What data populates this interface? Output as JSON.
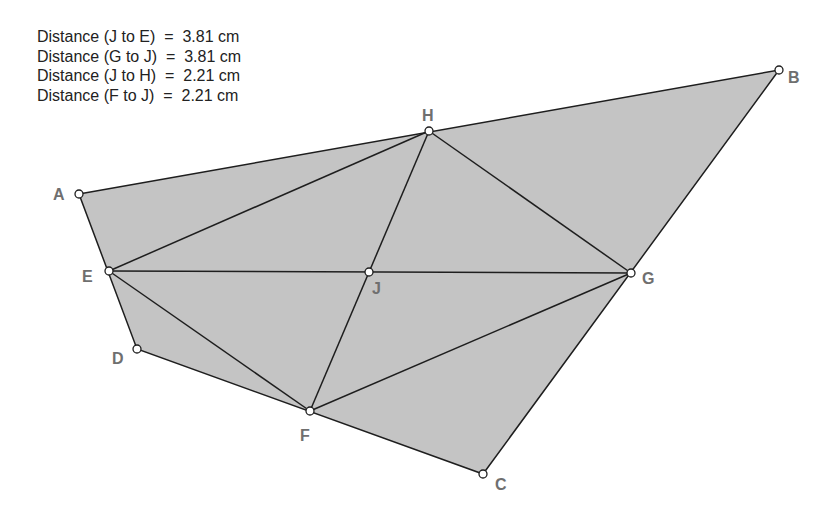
{
  "measurements": [
    {
      "label": "Distance (J to E)",
      "eq": "=",
      "value": "3.81 cm"
    },
    {
      "label": "Distance (G to J)",
      "eq": "=",
      "value": "3.81 cm"
    },
    {
      "label": "Distance (J to H)",
      "eq": "=",
      "value": "2.21 cm"
    },
    {
      "label": "Distance (F to J)",
      "eq": "=",
      "value": "2.21 cm"
    }
  ],
  "colors": {
    "fill": "#c4c4c4",
    "stroke": "#1e1e1e",
    "label": "#6f6f6f",
    "text": "#222222"
  },
  "points": {
    "A": {
      "label": "A",
      "x": 79,
      "y": 194
    },
    "B": {
      "label": "B",
      "x": 779,
      "y": 70
    },
    "C": {
      "label": "C",
      "x": 483,
      "y": 474
    },
    "D": {
      "label": "D",
      "x": 137,
      "y": 349
    },
    "E": {
      "label": "E",
      "x": 109,
      "y": 271
    },
    "F": {
      "label": "F",
      "x": 310,
      "y": 411
    },
    "G": {
      "label": "G",
      "x": 631,
      "y": 273
    },
    "H": {
      "label": "H",
      "x": 429,
      "y": 131
    },
    "J": {
      "label": "J",
      "x": 369,
      "y": 272
    }
  }
}
